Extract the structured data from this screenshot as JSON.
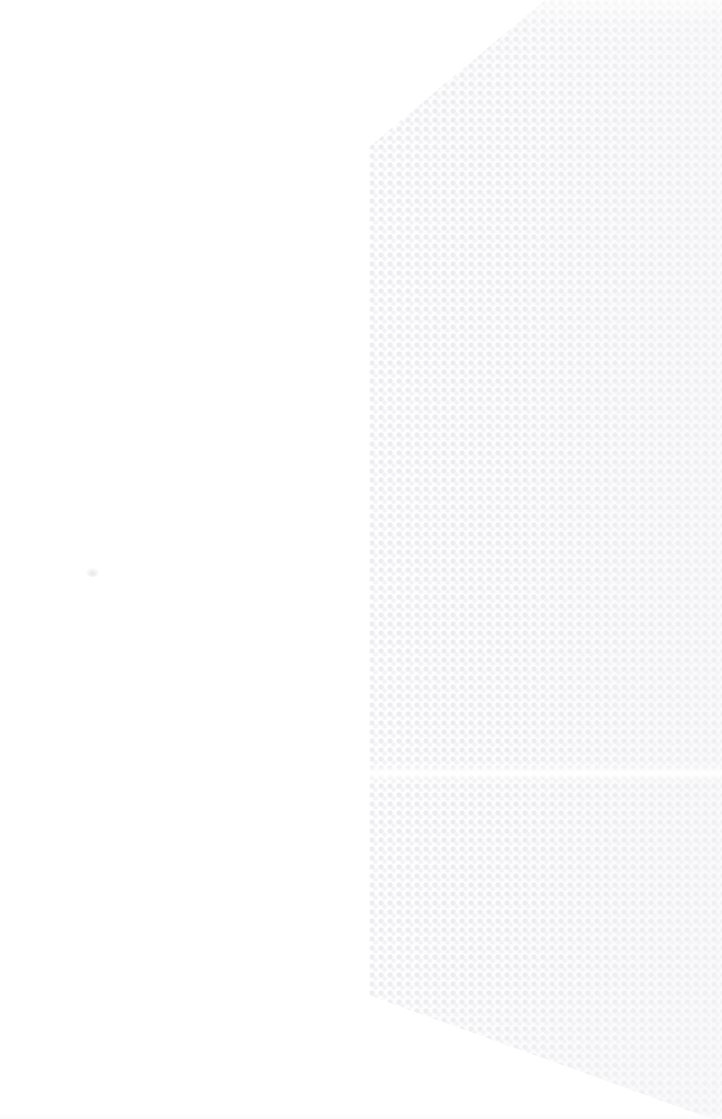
{
  "document": {
    "kind": "scanned-blank-page",
    "caption": "Blank scanned page with faint halftone screen pattern on the right side",
    "page_width": 722,
    "page_height": 1119,
    "background_color": "#ffffff"
  },
  "pattern": {
    "name": "halftone-dot-screen",
    "dot_color": "#ececef",
    "dot_secondary_color": "#f0f0f2",
    "dot_pitch_px": 9,
    "dot_radius_px": 2.4,
    "coverage_description": "right portion of the page",
    "top_diagonal_start_x": 545,
    "top_diagonal_end_x": 368,
    "top_diagonal_end_y": 148,
    "left_edge_x": 368,
    "bottom_diagonal_start_y": 995,
    "bottom_diagonal_end_x": 712,
    "bottom_diagonal_end_y": 1119,
    "light_band_y": 765,
    "light_band_height": 16
  },
  "artifacts": {
    "dust_mark_label": "dust speck",
    "dust_mark_x": 86,
    "dust_mark_y": 568
  },
  "blank_area": {
    "label": "blank paper area",
    "text": ""
  }
}
